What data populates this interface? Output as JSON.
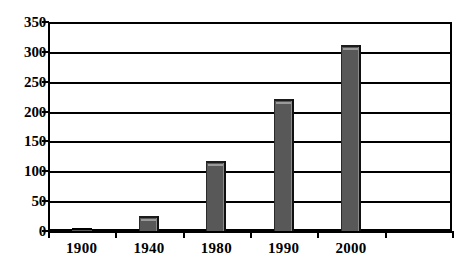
{
  "chart_data": {
    "type": "bar",
    "title": "",
    "subtitle": "",
    "xlabel": "",
    "ylabel": "",
    "categories": [
      "1900",
      "1940",
      "1980",
      "1990",
      "2000"
    ],
    "values": [
      3,
      25,
      117,
      221,
      312
    ],
    "ylim": [
      0,
      350
    ],
    "yticks": [
      0,
      50,
      100,
      150,
      200,
      250,
      300,
      350
    ],
    "ytick_labels": [
      "0",
      "50",
      "100",
      "150",
      "200",
      "250",
      "300",
      "350"
    ],
    "xtick_labels": [
      "1900",
      "1940",
      "1980",
      "1990",
      "2000"
    ],
    "grid": true,
    "grid_axis": "y",
    "legend": false,
    "legend_position": "none",
    "bar_color": "#585858",
    "bar_edge_color": "#000000",
    "axis_color": "#000000",
    "background_color": "#ffffff",
    "style": "3d-shaded-bars",
    "n_x_intervals": 6
  }
}
